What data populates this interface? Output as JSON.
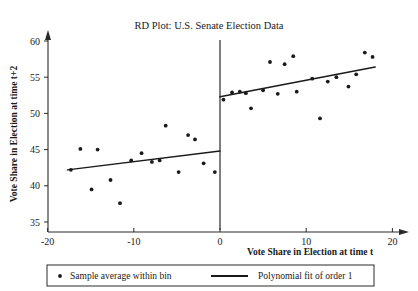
{
  "chart_data": {
    "type": "scatter",
    "title": "RD Plot: U.S. Senate Election Data",
    "xlabel": "Vote Share in Election at time t",
    "ylabel": "Vote Share in Election at time t+2",
    "xlim": [
      -21.5,
      21.5
    ],
    "ylim": [
      33.5,
      61.5
    ],
    "xticks": [
      -20,
      -10,
      0,
      10,
      20
    ],
    "yticks": [
      35,
      40,
      45,
      50,
      55,
      60
    ],
    "grid": false,
    "legend_position": "bottom",
    "cutoff": 0,
    "annotations": {
      "cutoff_line": "vertical line at x = 0 marking the RD threshold"
    },
    "series": [
      {
        "name": "Sample average within bin",
        "type": "scatter",
        "marker": "dot",
        "color": "#1a1a1a",
        "points_left": [
          {
            "x": -17.3,
            "y": 42.2
          },
          {
            "x": -16.2,
            "y": 45.1
          },
          {
            "x": -14.9,
            "y": 39.5
          },
          {
            "x": -14.2,
            "y": 45.0
          },
          {
            "x": -12.7,
            "y": 40.8
          },
          {
            "x": -11.6,
            "y": 37.6
          },
          {
            "x": -10.3,
            "y": 43.5
          },
          {
            "x": -9.1,
            "y": 44.5
          },
          {
            "x": -7.9,
            "y": 43.3
          },
          {
            "x": -7.0,
            "y": 43.5
          },
          {
            "x": -6.3,
            "y": 48.3
          },
          {
            "x": -4.8,
            "y": 41.9
          },
          {
            "x": -3.7,
            "y": 47.0
          },
          {
            "x": -2.9,
            "y": 46.4
          },
          {
            "x": -1.9,
            "y": 43.1
          },
          {
            "x": -0.6,
            "y": 41.9
          }
        ],
        "points_right": [
          {
            "x": 0.4,
            "y": 51.9
          },
          {
            "x": 1.4,
            "y": 52.9
          },
          {
            "x": 2.3,
            "y": 53.0
          },
          {
            "x": 3.0,
            "y": 52.8
          },
          {
            "x": 3.6,
            "y": 50.7
          },
          {
            "x": 5.0,
            "y": 53.2
          },
          {
            "x": 5.8,
            "y": 57.1
          },
          {
            "x": 6.7,
            "y": 52.7
          },
          {
            "x": 7.5,
            "y": 56.8
          },
          {
            "x": 8.5,
            "y": 57.9
          },
          {
            "x": 8.9,
            "y": 53.0
          },
          {
            "x": 10.7,
            "y": 54.8
          },
          {
            "x": 11.6,
            "y": 49.3
          },
          {
            "x": 12.5,
            "y": 54.4
          },
          {
            "x": 13.5,
            "y": 55.0
          },
          {
            "x": 14.9,
            "y": 53.7
          },
          {
            "x": 15.8,
            "y": 55.4
          },
          {
            "x": 16.8,
            "y": 58.4
          },
          {
            "x": 17.7,
            "y": 57.8
          }
        ]
      },
      {
        "name": "Polynomial fit of order 1",
        "type": "line",
        "color": "#1a1a1a",
        "fit_left": {
          "x_start": -17.7,
          "y_start": 42.2,
          "x_end": 0.0,
          "y_end": 44.8
        },
        "fit_right": {
          "x_start": 0.0,
          "y_start": 52.3,
          "x_end": 18.0,
          "y_end": 56.4
        }
      }
    ]
  },
  "legend": {
    "entries": [
      {
        "label": "Sample average within bin",
        "marker": "dot"
      },
      {
        "label": "Polynomial fit of order 1",
        "marker": "line"
      }
    ]
  }
}
